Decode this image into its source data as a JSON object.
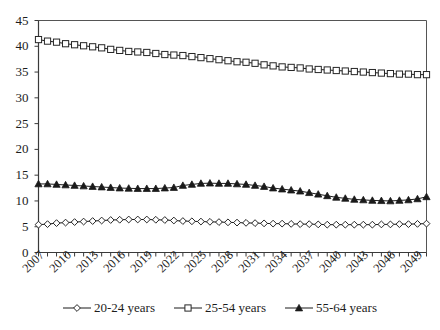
{
  "chart_data": {
    "type": "line",
    "title": "",
    "subtitle": "",
    "xlabel": "",
    "ylabel": "",
    "xlim": [
      2007,
      2050
    ],
    "ylim": [
      0,
      45
    ],
    "ytick_step": 5,
    "grid": false,
    "legend_position": "bottom",
    "yticks": [
      "0",
      "5",
      "10",
      "15",
      "20",
      "25",
      "30",
      "35",
      "40",
      "45"
    ],
    "x": [
      2007,
      2008,
      2009,
      2010,
      2011,
      2012,
      2013,
      2014,
      2015,
      2016,
      2017,
      2018,
      2019,
      2020,
      2021,
      2022,
      2023,
      2024,
      2025,
      2026,
      2027,
      2028,
      2029,
      2030,
      2031,
      2032,
      2033,
      2034,
      2035,
      2036,
      2037,
      2038,
      2039,
      2040,
      2041,
      2042,
      2043,
      2044,
      2045,
      2046,
      2047,
      2048,
      2049,
      2050
    ],
    "xtick_labels": [
      "2007",
      "2010",
      "2013",
      "2016",
      "2019",
      "2022",
      "2025",
      "2028",
      "2031",
      "2034",
      "2037",
      "2040",
      "2043",
      "2046",
      "2049"
    ],
    "xtick_values": [
      2007,
      2010,
      2013,
      2016,
      2019,
      2022,
      2025,
      2028,
      2031,
      2034,
      2037,
      2040,
      2043,
      2046,
      2049
    ],
    "series": [
      {
        "name": "20-24 years",
        "marker": "diamond",
        "color": "#1a1a1a",
        "values": [
          5.4,
          5.5,
          5.7,
          5.8,
          5.9,
          6.0,
          6.1,
          6.2,
          6.3,
          6.35,
          6.4,
          6.4,
          6.4,
          6.35,
          6.3,
          6.2,
          6.1,
          6.05,
          6.0,
          5.95,
          5.9,
          5.85,
          5.8,
          5.75,
          5.7,
          5.65,
          5.6,
          5.6,
          5.55,
          5.5,
          5.5,
          5.45,
          5.4,
          5.4,
          5.4,
          5.4,
          5.4,
          5.4,
          5.45,
          5.45,
          5.5,
          5.5,
          5.55,
          5.6
        ]
      },
      {
        "name": "25-54 years",
        "marker": "square",
        "color": "#1a1a1a",
        "values": [
          41.3,
          41.0,
          40.8,
          40.5,
          40.3,
          40.1,
          39.9,
          39.7,
          39.4,
          39.2,
          39.0,
          38.9,
          38.8,
          38.6,
          38.4,
          38.3,
          38.2,
          38.0,
          37.8,
          37.6,
          37.4,
          37.2,
          37.0,
          36.9,
          36.7,
          36.4,
          36.2,
          36.0,
          35.9,
          35.8,
          35.6,
          35.5,
          35.4,
          35.3,
          35.2,
          35.1,
          35.0,
          34.9,
          34.8,
          34.7,
          34.6,
          34.6,
          34.5,
          34.5
        ]
      },
      {
        "name": "55-64 years",
        "marker": "triangle",
        "color": "#1a1a1a",
        "values": [
          13.3,
          13.3,
          13.2,
          13.1,
          13.0,
          12.9,
          12.8,
          12.7,
          12.6,
          12.5,
          12.45,
          12.4,
          12.4,
          12.4,
          12.5,
          12.6,
          13.0,
          13.2,
          13.4,
          13.45,
          13.4,
          13.4,
          13.3,
          13.2,
          13.0,
          12.8,
          12.5,
          12.3,
          12.1,
          11.9,
          11.6,
          11.3,
          11.0,
          10.7,
          10.5,
          10.3,
          10.2,
          10.1,
          10.05,
          10.0,
          10.1,
          10.2,
          10.4,
          10.8
        ]
      }
    ]
  },
  "legend": {
    "entries": [
      {
        "label": "20-24 years",
        "marker": "diamond"
      },
      {
        "label": "25-54 years",
        "marker": "square"
      },
      {
        "label": "55-64 years",
        "marker": "triangle"
      }
    ]
  }
}
